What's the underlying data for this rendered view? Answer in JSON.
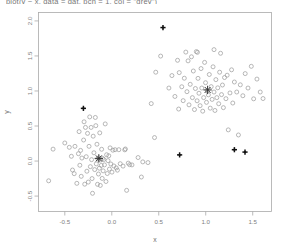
{
  "chart_data": {
    "type": "scatter",
    "title": "plot(y ~ x, data = dat, pch = 1, col = \"grey\")",
    "xlabel": "x",
    "ylabel": "y",
    "grid": false,
    "legend": "none",
    "xlim": [
      -0.78,
      1.7
    ],
    "ylim": [
      -0.72,
      2.12
    ],
    "xticks": [
      -0.5,
      0.0,
      0.5,
      1.0,
      1.5
    ],
    "xticklabels": [
      "-0.5",
      "0.0",
      "0.5",
      "1.0",
      "1.5"
    ],
    "yticks": [
      -0.5,
      0.0,
      0.5,
      1.0,
      1.5,
      2.0
    ],
    "yticklabels": [
      "-0.5",
      "0.0",
      "0.5",
      "1.0",
      "1.5",
      "2.0"
    ],
    "series": [
      {
        "name": "cluster-1-points",
        "marker": "open-circle",
        "color": "#9a9a9a",
        "points": [
          [
            -0.672,
            -0.282
          ],
          [
            -0.625,
            0.17
          ],
          [
            -0.5,
            0.258
          ],
          [
            -0.452,
            0.196
          ],
          [
            -0.43,
            0.068
          ],
          [
            -0.418,
            -0.128
          ],
          [
            -0.4,
            -0.18
          ],
          [
            -0.392,
            0.21
          ],
          [
            -0.372,
            -0.318
          ],
          [
            -0.355,
            0.105
          ],
          [
            -0.348,
            0.42
          ],
          [
            -0.34,
            -0.06
          ],
          [
            -0.332,
            0.152
          ],
          [
            -0.325,
            -0.218
          ],
          [
            -0.318,
            0.043
          ],
          [
            -0.3,
            0.3
          ],
          [
            -0.295,
            0.56
          ],
          [
            -0.288,
            -0.33
          ],
          [
            -0.28,
            0.48
          ],
          [
            -0.272,
            0.062
          ],
          [
            -0.265,
            -0.145
          ],
          [
            -0.258,
            0.395
          ],
          [
            -0.25,
            -0.3
          ],
          [
            -0.242,
            0.21
          ],
          [
            -0.235,
            0.63
          ],
          [
            -0.228,
            -0.08
          ],
          [
            -0.22,
            0.48
          ],
          [
            -0.215,
            0.02
          ],
          [
            -0.21,
            -0.25
          ],
          [
            -0.205,
            -0.46
          ],
          [
            -0.198,
            0.355
          ],
          [
            -0.19,
            0.118
          ],
          [
            -0.182,
            -0.122
          ],
          [
            -0.175,
            0.622
          ],
          [
            -0.17,
            0.505
          ],
          [
            -0.165,
            -0.04
          ],
          [
            -0.158,
            0.24
          ],
          [
            -0.152,
            -0.332
          ],
          [
            -0.148,
            0.03
          ],
          [
            -0.142,
            -0.185
          ],
          [
            -0.138,
            0.045
          ],
          [
            -0.132,
            -0.102
          ],
          [
            -0.128,
            0.402
          ],
          [
            -0.122,
            -0.348
          ],
          [
            -0.118,
            0.015
          ],
          [
            -0.112,
            -0.062
          ],
          [
            -0.108,
            0.168
          ],
          [
            -0.102,
            -0.248
          ],
          [
            -0.098,
            0.038
          ],
          [
            -0.092,
            -0.14
          ],
          [
            -0.085,
            0.022
          ],
          [
            -0.078,
            -0.055
          ],
          [
            -0.07,
            0.53
          ],
          [
            -0.062,
            -0.292
          ],
          [
            -0.055,
            0.09
          ],
          [
            -0.048,
            -0.178
          ],
          [
            -0.04,
            0.006
          ],
          [
            -0.032,
            0.075
          ],
          [
            -0.025,
            -0.115
          ],
          [
            -0.018,
            0.188
          ],
          [
            -0.01,
            -0.042
          ],
          [
            0.002,
            -0.158
          ],
          [
            0.012,
            0.155
          ],
          [
            0.022,
            -0.07
          ],
          [
            0.035,
            0.162
          ],
          [
            0.048,
            -0.098
          ],
          [
            0.06,
            -0.13
          ],
          [
            0.075,
            0.162
          ],
          [
            0.09,
            -0.038
          ],
          [
            0.12,
            -0.072
          ],
          [
            0.138,
            0.16
          ],
          [
            0.145,
            0.172
          ],
          [
            0.158,
            -0.418
          ],
          [
            0.175,
            -0.03
          ],
          [
            0.19,
            -0.052
          ],
          [
            0.215,
            -0.055
          ],
          [
            0.28,
            0.05
          ],
          [
            0.315,
            -0.228
          ],
          [
            0.33,
            -0.012
          ],
          [
            0.385,
            -0.022
          ],
          [
            0.42,
            0.82
          ],
          [
            0.455,
            0.335
          ]
        ]
      },
      {
        "name": "cluster-2-points",
        "marker": "open-circle",
        "color": "#9a9a9a",
        "points": [
          [
            0.468,
            1.268
          ],
          [
            0.52,
            1.498
          ],
          [
            0.608,
            1.042
          ],
          [
            0.64,
            1.22
          ],
          [
            0.672,
            0.922
          ],
          [
            0.7,
            1.438
          ],
          [
            0.712,
            0.742
          ],
          [
            0.745,
            1.06
          ],
          [
            0.76,
            0.862
          ],
          [
            0.772,
            1.182
          ],
          [
            0.788,
            1.555
          ],
          [
            0.8,
            0.99
          ],
          [
            0.812,
            1.43
          ],
          [
            0.822,
            0.802
          ],
          [
            0.835,
            1.095
          ],
          [
            0.848,
            1.488
          ],
          [
            0.858,
            0.905
          ],
          [
            0.868,
            1.285
          ],
          [
            0.88,
            0.735
          ],
          [
            0.89,
            1.035
          ],
          [
            0.9,
            1.562
          ],
          [
            0.908,
            0.86
          ],
          [
            0.918,
            1.18
          ],
          [
            0.928,
            0.968
          ],
          [
            0.94,
            0.79
          ],
          [
            0.95,
            1.32
          ],
          [
            0.958,
            1.042
          ],
          [
            0.968,
            0.712
          ],
          [
            0.978,
            0.905
          ],
          [
            0.988,
            1.408
          ],
          [
            0.998,
            1.118
          ],
          [
            1.008,
            0.838
          ],
          [
            1.018,
            1.002
          ],
          [
            1.028,
            0.945
          ],
          [
            1.038,
            1.235
          ],
          [
            1.048,
            0.755
          ],
          [
            1.058,
            1.062
          ],
          [
            1.068,
            0.88
          ],
          [
            1.078,
            1.345
          ],
          [
            1.088,
            0.985
          ],
          [
            1.098,
            0.722
          ],
          [
            1.108,
            1.162
          ],
          [
            1.118,
            0.905
          ],
          [
            1.128,
            1.045
          ],
          [
            1.138,
            0.818
          ],
          [
            1.148,
            1.268
          ],
          [
            1.158,
            1.538
          ],
          [
            1.168,
            0.948
          ],
          [
            1.178,
            1.085
          ],
          [
            1.188,
            0.762
          ],
          [
            1.2,
            1.192
          ],
          [
            1.215,
            0.89
          ],
          [
            1.228,
            1.225
          ],
          [
            1.24,
            0.445
          ],
          [
            1.258,
            0.972
          ],
          [
            1.275,
            1.302
          ],
          [
            1.288,
            0.828
          ],
          [
            1.305,
            1.128
          ],
          [
            1.33,
            0.985
          ],
          [
            1.348,
            0.372
          ],
          [
            1.368,
            1.088
          ],
          [
            1.395,
            0.932
          ],
          [
            1.42,
            1.248
          ],
          [
            1.45,
            1.042
          ],
          [
            1.485,
            1.352
          ],
          [
            1.51,
            0.888
          ],
          [
            1.545,
            1.17
          ],
          [
            1.58,
            0.985
          ],
          [
            1.61,
            0.892
          ],
          [
            1.088,
            1.59
          ],
          [
            0.912,
            1.552
          ],
          [
            0.718,
            1.262
          ]
        ]
      },
      {
        "name": "outlier-markers",
        "marker": "filled-cross",
        "color": "#111111",
        "points": [
          [
            0.545,
            1.905
          ],
          [
            -0.302,
            0.752
          ],
          [
            0.722,
            0.088
          ],
          [
            1.305,
            0.162
          ],
          [
            1.418,
            0.128
          ]
        ]
      },
      {
        "name": "cluster-centroids",
        "marker": "star-cross",
        "color": "#333333",
        "points": [
          [
            -0.138,
            0.038
          ],
          [
            1.02,
            1.015
          ]
        ]
      }
    ]
  },
  "axes": {
    "x_label": "x",
    "y_label": "y"
  }
}
